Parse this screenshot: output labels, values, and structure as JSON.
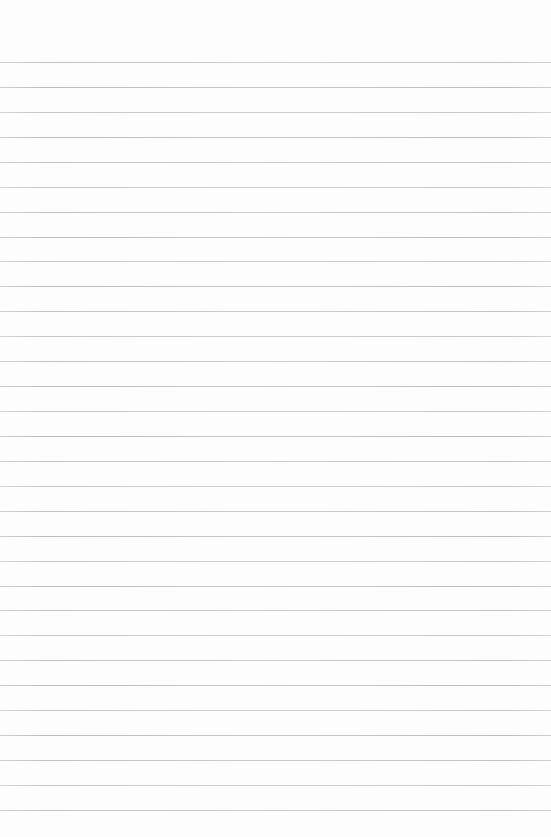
{
  "page": {
    "paper_color": "#fdfdfd",
    "line_color": "#bdbdbd",
    "ruled_lines": {
      "count": 31,
      "first_y_px": 62,
      "spacing_px": 24.93,
      "thickness_px": 1,
      "extends_full_width": true
    },
    "top_margin_px": 62,
    "bottom_margin_px": 27,
    "content_text": ""
  }
}
